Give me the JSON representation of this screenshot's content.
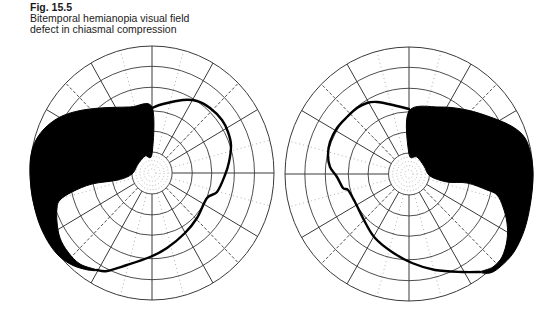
{
  "caption": {
    "figure_label": "Fig. 15.5",
    "line1": "Bitemporal hemianopia visual field",
    "line2": "defect in chiasmal compression"
  },
  "colors": {
    "grid_solid": "#3a3a3a",
    "grid_dotted": "#9a9a9a",
    "scotoma": "#000000",
    "isopter": "#000000",
    "background": "#ffffff"
  },
  "grid": {
    "ring_fractions": [
      0.165,
      0.33,
      0.49,
      0.675,
      0.84,
      1.0
    ],
    "solid_radials_deg": [
      0,
      30,
      60,
      90,
      120,
      150,
      180,
      210,
      240,
      270,
      300,
      330
    ],
    "dashed_radials_deg": [
      45,
      135,
      225,
      315
    ],
    "dotted_radials_deg": [
      15,
      75,
      105,
      165,
      195,
      255,
      285,
      345
    ],
    "central_dotted_rings": 4
  },
  "fields": [
    {
      "name": "left-eye-field",
      "cx": 152,
      "cy": 173,
      "rx": 122,
      "ry": 127,
      "scotoma_side": "left (temporal)",
      "scotoma_path": [
        [
          152,
          107
        ],
        [
          130,
          107
        ],
        [
          100,
          108
        ],
        [
          78,
          111
        ],
        [
          60,
          117
        ],
        [
          46,
          127
        ],
        [
          36,
          140
        ],
        [
          31,
          155
        ],
        [
          30,
          172
        ],
        [
          32,
          195
        ],
        [
          38,
          220
        ],
        [
          47,
          240
        ],
        [
          58,
          255
        ],
        [
          72,
          265
        ],
        [
          88,
          270
        ],
        [
          97,
          270
        ],
        [
          80,
          264
        ],
        [
          68,
          252
        ],
        [
          60,
          238
        ],
        [
          57,
          222
        ],
        [
          57,
          208
        ],
        [
          60,
          200
        ],
        [
          72,
          192
        ],
        [
          92,
          184
        ],
        [
          118,
          180
        ],
        [
          132,
          174
        ],
        [
          138,
          164
        ],
        [
          145,
          156
        ],
        [
          152,
          154
        ]
      ],
      "isopter_path": [
        [
          152,
          108
        ],
        [
          163,
          104
        ],
        [
          183,
          100
        ],
        [
          197,
          101
        ],
        [
          210,
          108
        ],
        [
          222,
          120
        ],
        [
          228,
          132
        ],
        [
          231,
          145
        ],
        [
          229,
          162
        ],
        [
          225,
          175
        ],
        [
          217,
          192
        ],
        [
          207,
          198
        ],
        [
          197,
          218
        ],
        [
          185,
          233
        ],
        [
          167,
          248
        ],
        [
          150,
          257
        ],
        [
          127,
          265
        ],
        [
          107,
          271
        ],
        [
          97,
          270
        ]
      ]
    },
    {
      "name": "right-eye-field",
      "cx": 409,
      "cy": 174,
      "rx": 124,
      "ry": 127,
      "scotoma_side": "right (temporal)",
      "scotoma_path": [
        [
          409,
          111
        ],
        [
          440,
          107
        ],
        [
          467,
          110
        ],
        [
          493,
          118
        ],
        [
          513,
          127
        ],
        [
          525,
          138
        ],
        [
          531,
          155
        ],
        [
          533,
          175
        ],
        [
          531,
          200
        ],
        [
          525,
          228
        ],
        [
          514,
          252
        ],
        [
          500,
          267
        ],
        [
          490,
          273
        ],
        [
          480,
          272
        ],
        [
          493,
          267
        ],
        [
          502,
          257
        ],
        [
          507,
          240
        ],
        [
          507,
          223
        ],
        [
          503,
          207
        ],
        [
          497,
          195
        ],
        [
          487,
          190
        ],
        [
          467,
          183
        ],
        [
          447,
          182
        ],
        [
          430,
          176
        ],
        [
          424,
          166
        ],
        [
          417,
          157
        ],
        [
          409,
          154
        ]
      ],
      "isopter_path": [
        [
          409,
          109
        ],
        [
          393,
          105
        ],
        [
          377,
          102
        ],
        [
          367,
          103
        ],
        [
          357,
          108
        ],
        [
          347,
          117
        ],
        [
          337,
          128
        ],
        [
          330,
          142
        ],
        [
          328,
          155
        ],
        [
          330,
          167
        ],
        [
          337,
          177
        ],
        [
          343,
          188
        ],
        [
          348,
          190
        ],
        [
          355,
          202
        ],
        [
          365,
          222
        ],
        [
          375,
          238
        ],
        [
          392,
          252
        ],
        [
          412,
          263
        ],
        [
          435,
          270
        ],
        [
          462,
          272
        ],
        [
          480,
          272
        ]
      ]
    }
  ]
}
